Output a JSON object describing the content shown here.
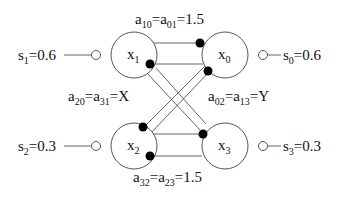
{
  "diagram": {
    "title": "",
    "nodes": [
      {
        "id": "x1",
        "label": "x",
        "sub": "1",
        "cx": 134,
        "cy": 55,
        "r": 23
      },
      {
        "id": "x0",
        "label": "x",
        "sub": "0",
        "cx": 225,
        "cy": 55,
        "r": 23
      },
      {
        "id": "x2",
        "label": "x",
        "sub": "2",
        "cx": 134,
        "cy": 146,
        "r": 23
      },
      {
        "id": "x3",
        "label": "x",
        "sub": "3",
        "cx": 225,
        "cy": 146,
        "r": 23
      }
    ],
    "inputs": [
      {
        "node": "x1",
        "label": "s",
        "sub": "1",
        "value": "=0.6"
      },
      {
        "node": "x0",
        "label": "s",
        "sub": "0",
        "value": "=0.6"
      },
      {
        "node": "x2",
        "label": "s",
        "sub": "2",
        "value": "=0.3"
      },
      {
        "node": "x3",
        "label": "s",
        "sub": "3",
        "value": "=0.3"
      }
    ],
    "couplings": [
      {
        "name": "a10_a01",
        "text": "a10=a01=1.5",
        "parts": [
          "a",
          "10",
          "=a",
          "01",
          "=1.5"
        ]
      },
      {
        "name": "a20_a31",
        "text": "a20=a31=X",
        "parts": [
          "a",
          "20",
          "=a",
          "31",
          "=X"
        ]
      },
      {
        "name": "a02_a13",
        "text": "a02=a13=Y",
        "parts": [
          "a",
          "02",
          "=a",
          "13",
          "=Y"
        ]
      },
      {
        "name": "a32_a23",
        "text": "a32=a23=1.5",
        "parts": [
          "a",
          "32",
          "=a",
          "23",
          "=1.5"
        ]
      }
    ],
    "edges": [
      {
        "from": "x1",
        "to": "x0",
        "note": "x1 -> x0 top"
      },
      {
        "from": "x0",
        "to": "x1",
        "note": "x0 -> x1"
      },
      {
        "from": "x2",
        "to": "x3"
      },
      {
        "from": "x3",
        "to": "x2"
      },
      {
        "from": "x1",
        "to": "x3",
        "note": "diagonal"
      },
      {
        "from": "x3",
        "to": "x1",
        "note": "diagonal"
      },
      {
        "from": "x2",
        "to": "x0",
        "note": "diagonal"
      },
      {
        "from": "x0",
        "to": "x2",
        "note": "diagonal"
      }
    ]
  }
}
